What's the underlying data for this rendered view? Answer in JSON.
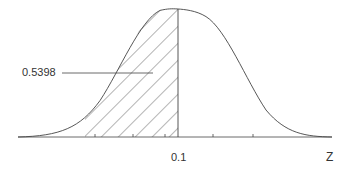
{
  "figure": {
    "type": "normal-distribution-diagram",
    "area_label": "0.5398",
    "tick_label": "0.1",
    "axis_label": "Z",
    "shaded_region": "left tail up to z = 0.1",
    "colors": {
      "line": "#444444",
      "background": "#ffffff",
      "text": "#333333"
    }
  }
}
